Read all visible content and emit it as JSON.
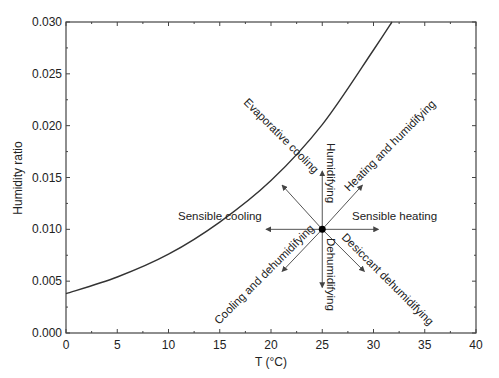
{
  "chart_data": {
    "type": "line",
    "title": "",
    "xlabel": "T (°C)",
    "ylabel": "Humidity ratio",
    "xlim": [
      0,
      40
    ],
    "ylim": [
      0.0,
      0.03
    ],
    "xticks": [
      "0",
      "5",
      "10",
      "15",
      "20",
      "25",
      "30",
      "35",
      "40"
    ],
    "yticks": [
      "0.000",
      "0.005",
      "0.010",
      "0.015",
      "0.020",
      "0.025",
      "0.030"
    ],
    "grid": false,
    "series": [
      {
        "name": "Saturation curve",
        "x": [
          0,
          5,
          10,
          15,
          20,
          25,
          30,
          31.8
        ],
        "y": [
          0.0038,
          0.0054,
          0.0076,
          0.0107,
          0.0147,
          0.0201,
          0.0273,
          0.03
        ]
      }
    ],
    "state_point": {
      "T": 25,
      "w": 0.01
    },
    "annotations": [
      {
        "label": "Sensible heating",
        "direction": "right"
      },
      {
        "label": "Sensible cooling",
        "direction": "left"
      },
      {
        "label": "Humidifying",
        "direction": "up"
      },
      {
        "label": "Dehumidifying",
        "direction": "down"
      },
      {
        "label": "Heating and humidifying",
        "direction": "up-right"
      },
      {
        "label": "Evaporative cooling",
        "direction": "up-left"
      },
      {
        "label": "Cooling and dehumidifying",
        "direction": "down-left"
      },
      {
        "label": "Desiccant dehumidifying",
        "direction": "down-right"
      }
    ]
  },
  "colors": {
    "axis": "#444444",
    "curve": "#333333",
    "arrow": "#555555",
    "point": "#000000"
  }
}
